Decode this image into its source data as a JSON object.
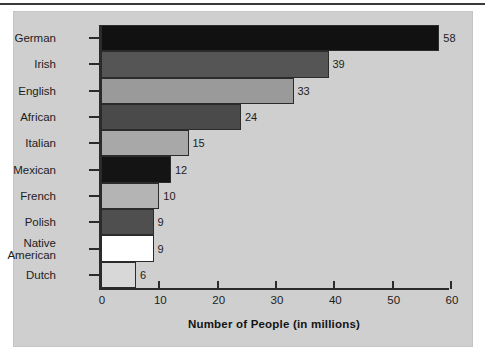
{
  "chart_data": {
    "type": "bar",
    "orientation": "horizontal",
    "title": "",
    "xlabel": "Number of People (in millions)",
    "ylabel": "",
    "categories": [
      "German",
      "Irish",
      "English",
      "African",
      "Italian",
      "Mexican",
      "French",
      "Polish",
      "Native\nAmerican",
      "Dutch"
    ],
    "values": [
      58,
      39,
      33,
      24,
      15,
      12,
      10,
      9,
      9,
      6
    ],
    "value_labels": [
      "58",
      "39",
      "33",
      "24",
      "15",
      "12",
      "10",
      "9",
      "9",
      "6"
    ],
    "bar_colors": [
      "#111111",
      "#555555",
      "#9a9a9a",
      "#4a4a4a",
      "#a8a8a8",
      "#141414",
      "#b4b4b4",
      "#4f4f4f",
      "#ffffff",
      "#d8d8d8"
    ],
    "xlim": [
      0,
      60
    ],
    "xticks": [
      0,
      10,
      20,
      30,
      40,
      50,
      60
    ],
    "xtick_labels": [
      "0",
      "10",
      "20",
      "30",
      "40",
      "50",
      "60"
    ],
    "grid": false,
    "legend": null,
    "background_color": "#cfcfcf",
    "axis_color": "#2b2b2b"
  }
}
